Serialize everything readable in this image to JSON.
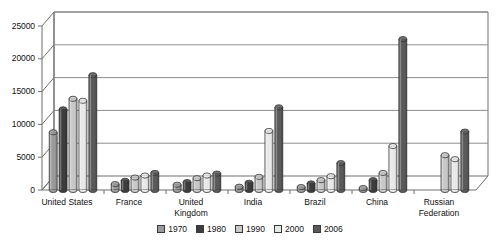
{
  "chart_data": {
    "type": "bar",
    "title": "",
    "subtitle": "",
    "xlabel": "",
    "ylabel": "",
    "ylim": [
      0,
      25000
    ],
    "yticks": [
      "0",
      "5000",
      "10000",
      "15000",
      "20000",
      "25000"
    ],
    "ytick_values": [
      0,
      5000,
      10000,
      15000,
      20000,
      25000
    ],
    "grid": true,
    "legend_position": "bottom",
    "style": "3d-cylinder-column",
    "categories": [
      "United States",
      "France",
      "United\nKingdom",
      "India",
      "Brazil",
      "China",
      "Russian\nFederation"
    ],
    "series": [
      {
        "name": "1970",
        "color": "#9a9a9a",
        "values": [
          8800,
          900,
          800,
          500,
          450,
          300,
          null
        ]
      },
      {
        "name": "1980",
        "color": "#3d3d3d",
        "values": [
          12300,
          1400,
          1200,
          1100,
          1000,
          1500,
          null
        ]
      },
      {
        "name": "1990",
        "color": "#c8c8c8",
        "values": [
          13900,
          1900,
          1800,
          2000,
          1500,
          2600,
          5300
        ]
      },
      {
        "name": "2000",
        "color": "#e8e8e8",
        "values": [
          13600,
          2200,
          2200,
          9000,
          2100,
          6700,
          4700
        ]
      },
      {
        "name": "2006",
        "color": "#5a5a5a",
        "values": [
          17500,
          2600,
          2500,
          12600,
          4100,
          23000,
          8900
        ]
      }
    ]
  },
  "legend": {
    "items": [
      {
        "label": "1970"
      },
      {
        "label": "1980"
      },
      {
        "label": "1990"
      },
      {
        "label": "2000"
      },
      {
        "label": "2006"
      }
    ]
  },
  "colors": {
    "axis": "#6e6e6e",
    "grid": "#8d8d8d",
    "text": "#111111",
    "background": "#ffffff",
    "bar_outline": "#3a3a3a"
  }
}
